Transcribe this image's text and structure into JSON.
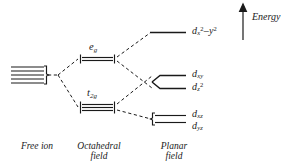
{
  "figure": {
    "type": "energy-level-splitting-diagram",
    "ink_color": "#1a1a1a",
    "background": "#ffffff"
  },
  "energy_axis": {
    "label": "Energy",
    "direction": "up",
    "arrow_icon": "up-arrow-icon"
  },
  "columns": [
    {
      "id": "free-ion",
      "caption_line1": "Free ion",
      "caption_line2": ""
    },
    {
      "id": "octahedral",
      "caption_line1": "Octahedral",
      "caption_line2": "field"
    },
    {
      "id": "planar",
      "caption_line1": "Planar",
      "caption_line2": "field"
    }
  ],
  "free_ion": {
    "degeneracy": 5,
    "level_count": 5,
    "brace": "right-brace"
  },
  "octahedral_levels": [
    {
      "id": "eg",
      "term": "e",
      "term_sub": "g",
      "lines": 2,
      "degeneracy": 2
    },
    {
      "id": "t2g",
      "term": "t",
      "term_sub": "2g",
      "lines": 3,
      "degeneracy": 3
    }
  ],
  "planar_levels": [
    {
      "id": "dx2-y2",
      "base": "d",
      "sub": "x",
      "sup1": "2",
      "mid": "–",
      "sub2": "y",
      "sup2": "2",
      "text": "dx2–y2",
      "lines": 1
    },
    {
      "id": "dxy",
      "base": "d",
      "sub": "xy",
      "sup1": "",
      "text": "dxy",
      "lines": 1
    },
    {
      "id": "dz2",
      "base": "d",
      "sub": "z",
      "sup1": "2",
      "text": "dz2",
      "lines": 1
    },
    {
      "id": "dxz",
      "base": "d",
      "sub": "xz",
      "sup1": "",
      "text": "dxz",
      "lines": 1
    },
    {
      "id": "dyz",
      "base": "d",
      "sub": "yz",
      "sup1": "",
      "text": "dyz",
      "lines": 1
    }
  ],
  "correlation_lines": {
    "style": "dashed",
    "count": 7
  }
}
